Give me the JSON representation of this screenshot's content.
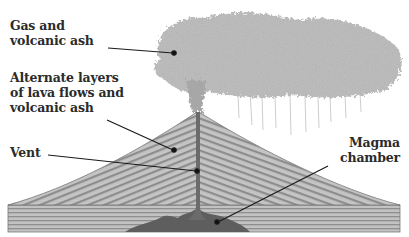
{
  "diagram": {
    "labels": [
      {
        "id": "gas-ash",
        "lines": [
          "Gas and",
          "volcanic ash"
        ],
        "align": "left"
      },
      {
        "id": "layers",
        "lines": [
          "Alternate layers",
          "of lava flows and",
          "volcanic ash"
        ],
        "align": "left"
      },
      {
        "id": "vent",
        "lines": [
          "Vent"
        ],
        "align": "left"
      },
      {
        "id": "magma",
        "lines": [
          "Magma",
          "chamber"
        ],
        "align": "right"
      }
    ],
    "colors": {
      "text": "#2b2b2b",
      "leader": "#1a1a1a",
      "cone_fill": "#bdbdbd",
      "cone_stripe": "#8a8a8a",
      "ground_fill": "#b5b5b5",
      "magma_fill": "#5a5a5a",
      "plume": "#9a9a9a"
    }
  }
}
